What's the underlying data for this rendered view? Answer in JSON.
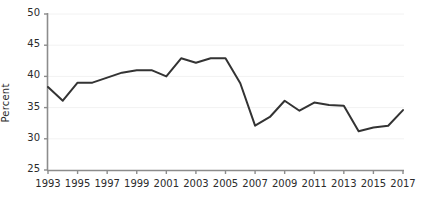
{
  "chart_data": {
    "type": "line",
    "title": "",
    "xlabel": "",
    "ylabel": "Percent",
    "xlim": [
      1993,
      2017
    ],
    "ylim": [
      25,
      50
    ],
    "grid": true,
    "legend": "none",
    "x": [
      1993,
      1994,
      1995,
      1996,
      1997,
      1998,
      1999,
      2000,
      2001,
      2002,
      2003,
      2004,
      2005,
      2006,
      2007,
      2008,
      2009,
      2010,
      2011,
      2012,
      2013,
      2014,
      2015,
      2016,
      2017
    ],
    "values": [
      38.3,
      36.1,
      39.0,
      39.0,
      39.8,
      40.6,
      41.0,
      41.0,
      40.0,
      42.9,
      42.2,
      42.9,
      42.9,
      38.9,
      32.1,
      33.5,
      36.1,
      34.5,
      35.8,
      35.4,
      35.3,
      31.2,
      31.8,
      32.1,
      34.6
    ],
    "series": [
      {
        "name": "Percent",
        "color": "#333333",
        "values": [
          38.3,
          36.1,
          39.0,
          39.0,
          39.8,
          40.6,
          41.0,
          41.0,
          40.0,
          42.9,
          42.2,
          42.9,
          42.9,
          38.9,
          32.1,
          33.5,
          36.1,
          34.5,
          35.8,
          35.4,
          35.3,
          31.2,
          31.8,
          32.1,
          34.6
        ]
      }
    ],
    "y_ticks": [
      25,
      30,
      35,
      40,
      45,
      50
    ],
    "y_tick_labels": [
      "25",
      "30",
      "35",
      "40",
      "45",
      "50"
    ],
    "x_ticks": [
      1993,
      1995,
      1997,
      1999,
      2001,
      2003,
      2005,
      2007,
      2009,
      2011,
      2013,
      2015,
      2017
    ],
    "x_tick_labels": [
      "1993",
      "1995",
      "1997",
      "1999",
      "2001",
      "2003",
      "2005",
      "2007",
      "2009",
      "2011",
      "2013",
      "2015",
      "2017"
    ],
    "colors": {
      "line": "#333333",
      "axis": "#808080",
      "grid": "#f2f2f2",
      "text": "#2b2b2b",
      "background": "#ffffff"
    }
  }
}
